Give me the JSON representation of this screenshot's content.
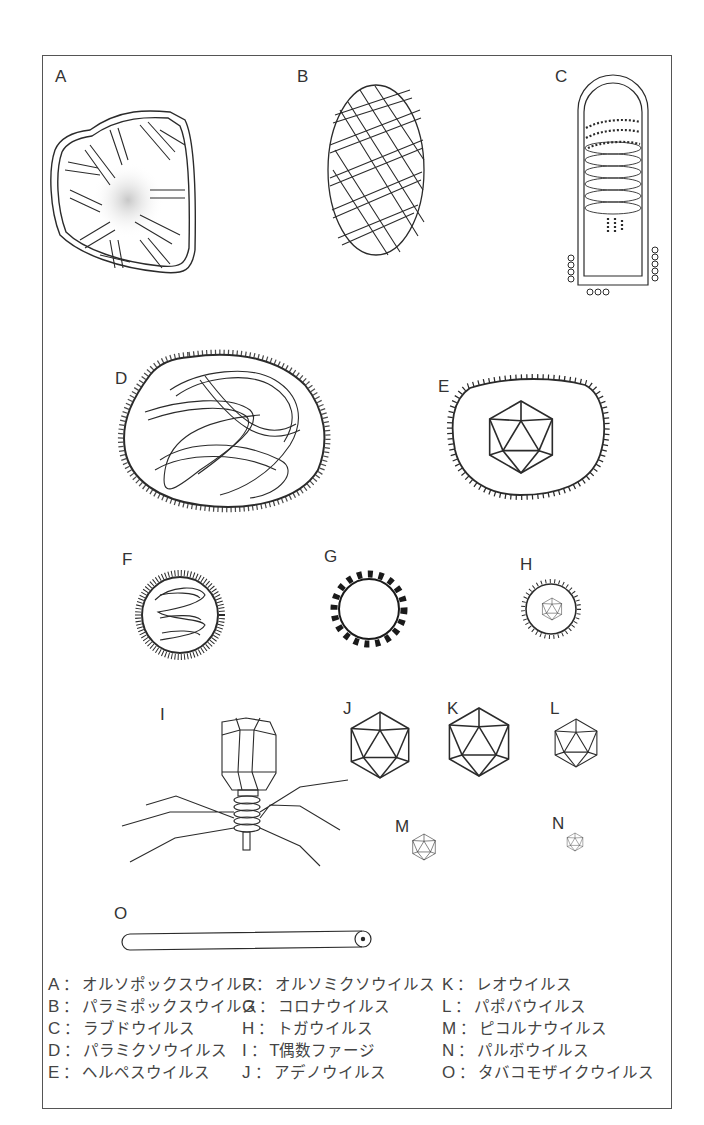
{
  "figure": {
    "title": "",
    "panels": [
      {
        "key": "A",
        "name": "オルソポックスウイルス",
        "shape": "brick-shaped envelope with rod-like tubules and central dense core"
      },
      {
        "key": "B",
        "name": "パラミポックスウイルス",
        "shape": "ovoid with crisscross spiral filaments"
      },
      {
        "key": "C",
        "name": "ラブドウイルス",
        "shape": "bullet-shaped with helical nucleocapsid and surface spikes"
      },
      {
        "key": "D",
        "name": "パラミクソウイルス",
        "shape": "pleomorphic spiked envelope with tangled helical nucleocapsid"
      },
      {
        "key": "E",
        "name": "ヘルペスウイルス",
        "shape": "spiked envelope containing icosahedral capsid"
      },
      {
        "key": "F",
        "name": "オルソミクソウイルス",
        "shape": "spherical spiked envelope with coiled nucleocapsid"
      },
      {
        "key": "G",
        "name": "コロナウイルス",
        "shape": "circle with club-shaped peplomers"
      },
      {
        "key": "H",
        "name": "トガウイルス",
        "shape": "small spiked envelope with icosahedral core"
      },
      {
        "key": "I",
        "name": "T偶数ファージ",
        "shape": "bacteriophage with head, contractile tail and tail fibers"
      },
      {
        "key": "J",
        "name": "アデノウイルス",
        "shape": "icosahedron (large)"
      },
      {
        "key": "K",
        "name": "レオウイルス",
        "shape": "icosahedron (large)"
      },
      {
        "key": "L",
        "name": "パポバウイルス",
        "shape": "icosahedron (medium)"
      },
      {
        "key": "M",
        "name": "ピコルナウイルス",
        "shape": "icosahedron (small)"
      },
      {
        "key": "N",
        "name": "パルボウイルス",
        "shape": "icosahedron (smallest)"
      },
      {
        "key": "O",
        "name": "タバコモザイクウイルス",
        "shape": "long rigid rod"
      }
    ]
  },
  "labels": {
    "A": "A",
    "B": "B",
    "C": "C",
    "D": "D",
    "E": "E",
    "F": "F",
    "G": "G",
    "H": "H",
    "I": "I",
    "J": "J",
    "K": "K",
    "L": "L",
    "M": "M",
    "N": "N",
    "O": "O"
  },
  "legend": {
    "separator": "：",
    "columns": [
      [
        {
          "key": "A",
          "name": "オルソポックスウイルス"
        },
        {
          "key": "B",
          "name": "パラミポックスウイルス"
        },
        {
          "key": "C",
          "name": "ラブドウイルス"
        },
        {
          "key": "D",
          "name": "パラミクソウイルス"
        },
        {
          "key": "E",
          "name": "ヘルペスウイルス"
        }
      ],
      [
        {
          "key": "F",
          "name": "オルソミクソウイルス"
        },
        {
          "key": "G",
          "name": "コロナウイルス"
        },
        {
          "key": "H",
          "name": "トガウイルス"
        },
        {
          "key": "I",
          "name": "T偶数ファージ"
        },
        {
          "key": "J",
          "name": "アデノウイルス"
        }
      ],
      [
        {
          "key": "K",
          "name": "レオウイルス"
        },
        {
          "key": "L",
          "name": "パポバウイルス"
        },
        {
          "key": "M",
          "name": "ピコルナウイルス"
        },
        {
          "key": "N",
          "name": "パルボウイルス"
        },
        {
          "key": "O",
          "name": "タバコモザイクウイルス"
        }
      ]
    ]
  },
  "colors": {
    "line": "#2b2b2b",
    "frame": "#555555",
    "background": "#ffffff",
    "text": "#444444"
  }
}
